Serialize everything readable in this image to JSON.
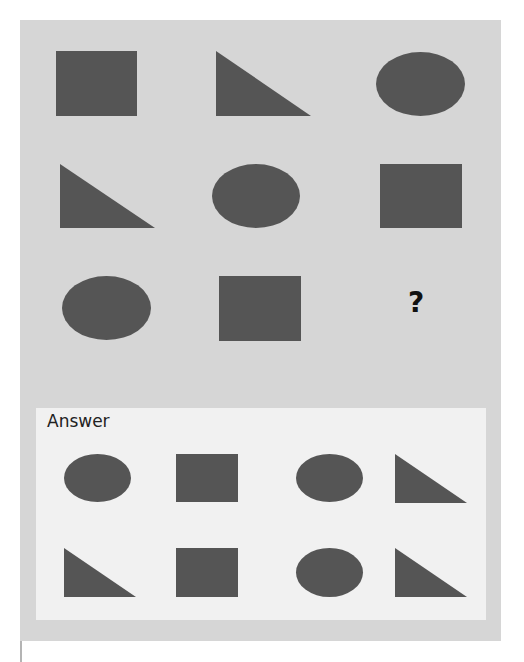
{
  "puzzle": {
    "colors": {
      "page_background": "#ffffff",
      "panel_background": "#d6d6d6",
      "answer_background": "#f1f1f1",
      "shape_fill": "#555555",
      "left_rule": "#b4b4b4"
    },
    "grid": [
      {
        "row": 1,
        "col": 1,
        "shape": "square"
      },
      {
        "row": 1,
        "col": 2,
        "shape": "right-triangle"
      },
      {
        "row": 1,
        "col": 3,
        "shape": "ellipse"
      },
      {
        "row": 2,
        "col": 1,
        "shape": "right-triangle"
      },
      {
        "row": 2,
        "col": 2,
        "shape": "ellipse"
      },
      {
        "row": 2,
        "col": 3,
        "shape": "square"
      },
      {
        "row": 3,
        "col": 1,
        "shape": "ellipse"
      },
      {
        "row": 3,
        "col": 2,
        "shape": "square"
      },
      {
        "row": 3,
        "col": 3,
        "shape": "question-mark"
      }
    ],
    "question_mark": "?"
  },
  "answer": {
    "label": "Answer",
    "options": [
      {
        "row": 1,
        "col": 1,
        "shape": "ellipse"
      },
      {
        "row": 1,
        "col": 2,
        "shape": "square"
      },
      {
        "row": 1,
        "col": 3,
        "shape": "ellipse"
      },
      {
        "row": 1,
        "col": 4,
        "shape": "right-triangle"
      },
      {
        "row": 2,
        "col": 1,
        "shape": "right-triangle"
      },
      {
        "row": 2,
        "col": 2,
        "shape": "square"
      },
      {
        "row": 2,
        "col": 3,
        "shape": "ellipse"
      },
      {
        "row": 2,
        "col": 4,
        "shape": "right-triangle"
      }
    ]
  }
}
